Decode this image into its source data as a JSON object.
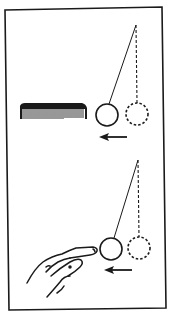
{
  "figure": {
    "colors": {
      "ink": "#1a1a1a",
      "background": "#ffffff"
    },
    "panels": [
      {
        "id": "top",
        "charged_object": "comb",
        "pendulum": {
          "pivot": [
            136,
            25
          ],
          "ball_deflected": [
            107,
            115
          ],
          "ball_rest": [
            137,
            114
          ],
          "radius": 11
        },
        "arrow": {
          "direction": "left",
          "from": [
            127,
            137
          ],
          "to": [
            100,
            137
          ]
        }
      },
      {
        "id": "bottom",
        "charged_object": "finger",
        "pendulum": {
          "pivot": [
            138,
            160
          ],
          "ball_deflected": [
            111,
            249
          ],
          "ball_rest": [
            139,
            248
          ],
          "radius": 11
        },
        "arrow": {
          "direction": "left",
          "from": [
            132,
            270
          ],
          "to": [
            105,
            270
          ]
        }
      }
    ]
  }
}
